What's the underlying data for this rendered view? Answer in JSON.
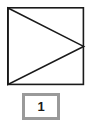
{
  "figure": {
    "name": "square-with-inscribed-right-pointing-triangle",
    "outer_shape": "square",
    "inner_shape": "triangle",
    "triangle_direction": "right",
    "stroke_color": "#1a1a1a",
    "fill_color": "#ffffff",
    "square": {
      "x": 7,
      "y": 7,
      "width": 77,
      "height": 78,
      "stroke_width": 1.6
    },
    "triangle": {
      "vertices": [
        {
          "x": 7,
          "y": 7
        },
        {
          "x": 84,
          "y": 46
        },
        {
          "x": 7,
          "y": 85
        }
      ],
      "stroke_width": 1.6
    }
  },
  "label": {
    "text": "1",
    "border_color": "#9a9a9a",
    "background_color": "#ffffff",
    "text_color": "#1a1a1a"
  },
  "canvas": {
    "width": 92,
    "height": 130,
    "background_color": "#ffffff"
  }
}
